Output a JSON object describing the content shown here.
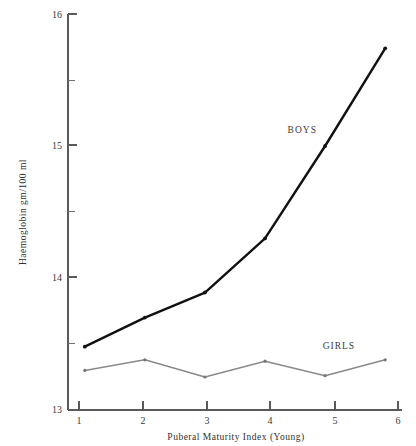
{
  "chart_data": {
    "type": "line",
    "title": "",
    "xlabel": "Puberal Maturity Index (Young)",
    "ylabel": "Haemoglobin gm/100 ml",
    "x": [
      1,
      2,
      3,
      4,
      5,
      6
    ],
    "xticklabels": [
      "1",
      "2",
      "3",
      "4",
      "5",
      "6"
    ],
    "yticklabels": [
      "13",
      "14",
      "15",
      "16"
    ],
    "yticks": [
      13,
      14,
      15,
      16
    ],
    "yminorticks": [
      13.5,
      14.5,
      15.5
    ],
    "xlim": [
      0.72,
      6.28
    ],
    "ylim": [
      13,
      16
    ],
    "grid": false,
    "legend_position": "inline-annotation",
    "series": [
      {
        "name": "BOYS",
        "color": "#111111",
        "values": [
          13.48,
          13.7,
          13.89,
          14.3,
          15.0,
          15.74
        ],
        "label_x": 4.62,
        "label_y": 15.1
      },
      {
        "name": "GIRLS",
        "color": "#8a8a8a",
        "values": [
          13.3,
          13.38,
          13.25,
          13.37,
          13.26,
          13.38
        ],
        "label_x": 5.23,
        "label_y": 13.46
      }
    ]
  },
  "labels": {
    "y_axis_title": "Haemoglobin gm/100 ml",
    "x_axis_title": "Puberal Maturity Index (Young)",
    "series_boys": "BOYS",
    "series_girls": "GIRLS",
    "y_tick_13": "13",
    "y_tick_14": "14",
    "y_tick_15": "15",
    "y_tick_16": "16",
    "x_tick_1": "1",
    "x_tick_2": "2",
    "x_tick_3": "3",
    "x_tick_4": "4",
    "x_tick_5": "5",
    "x_tick_6": "6"
  }
}
